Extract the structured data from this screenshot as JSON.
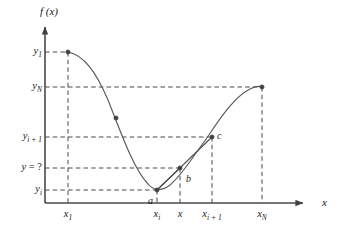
{
  "figure": {
    "axes": {
      "y_axis_label": "f (x)",
      "x_axis_label": "x",
      "y_axis_name": "f-of-x",
      "x_axis_name": "x"
    },
    "colors": {
      "curve": "#595959",
      "chord": "#4d4d4d",
      "axis": "#4a4a4a",
      "dashed": "#333333",
      "marker": "#404040",
      "text": "#1a1a1a",
      "background": "#ffffff"
    },
    "y_ticks": [
      {
        "id": "y1",
        "base": "y",
        "sub": "1",
        "equals": "",
        "value_px": 52
      },
      {
        "id": "yN",
        "base": "y",
        "sub": "N",
        "equals": "",
        "value_px": 87
      },
      {
        "id": "yi1",
        "base": "y",
        "sub": "i + 1",
        "equals": "",
        "value_px": 137
      },
      {
        "id": "yq",
        "base": "y",
        "sub": "",
        "equals": " = ?",
        "value_px": 168
      },
      {
        "id": "yi",
        "base": "y",
        "sub": "i",
        "equals": "",
        "value_px": 190
      }
    ],
    "y_tick_labels": [
      "y1",
      "yN",
      "yi+1",
      "y = ?",
      "yi"
    ],
    "x_ticks": [
      {
        "id": "x1",
        "base": "x",
        "sub": "1",
        "value_px": 68
      },
      {
        "id": "xi",
        "base": "x",
        "sub": "i",
        "value_px": 157
      },
      {
        "id": "x",
        "base": "x",
        "sub": "",
        "value_px": 180
      },
      {
        "id": "xi1",
        "base": "x",
        "sub": "i + 1",
        "value_px": 212
      },
      {
        "id": "xN",
        "base": "x",
        "sub": "N",
        "value_px": 262
      }
    ],
    "x_tick_labels": [
      "x1",
      "xi",
      "x",
      "xi+1",
      "xN"
    ],
    "point_labels": [
      {
        "id": "a",
        "text": "a",
        "x_px": 148,
        "y_px": 196
      },
      {
        "id": "b",
        "text": "b",
        "x_px": 186,
        "y_px": 174
      },
      {
        "id": "c",
        "text": "c",
        "x_px": 217,
        "y_px": 131
      }
    ],
    "data_points": [
      {
        "name": "first-sample",
        "x_px": 68,
        "y_px": 52,
        "x_label": "x1",
        "y_label": "y1"
      },
      {
        "name": "curve-sample-marker",
        "x_px": 116,
        "y_px": 118,
        "x_label": "",
        "y_label": ""
      },
      {
        "name": "point-a",
        "x_px": 157,
        "y_px": 190,
        "x_label": "xi",
        "y_label": "yi"
      },
      {
        "name": "interpolated-point",
        "x_px": 180,
        "y_px": 168,
        "x_label": "x",
        "y_label": "y = ?"
      },
      {
        "name": "point-c",
        "x_px": 212,
        "y_px": 137,
        "x_label": "xi+1",
        "y_label": "yi+1"
      },
      {
        "name": "last-sample",
        "x_px": 262,
        "y_px": 87,
        "x_label": "xN",
        "y_label": "yN"
      }
    ],
    "curve_path": "M 68,52 C 84,55 96,72 108,100 C 120,130 133,168 148,184 C 153,190 161,192 170,185 C 182,175 192,158 204,142 C 216,125 232,98 250,89 C 255,86 259,86 262,87",
    "chord_path": "M 157,190 L 212,137",
    "segment_ab_path": "M 157,190 L 180,168",
    "axis_geometry": {
      "origin_x_px": 45,
      "baseline_y_px": 203,
      "y_axis_top_px": 25,
      "x_axis_right_px": 313
    }
  }
}
